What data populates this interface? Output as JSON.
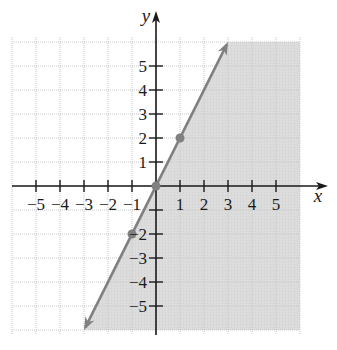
{
  "chart_data": {
    "type": "line",
    "title": "",
    "xlabel": "x",
    "ylabel": "y",
    "xlim": [
      -6,
      6
    ],
    "ylim": [
      -6,
      6
    ],
    "grid": true,
    "x_ticks": [
      -5,
      -4,
      -3,
      -2,
      -1,
      1,
      2,
      3,
      4,
      5
    ],
    "y_ticks": [
      -5,
      -4,
      -3,
      -2,
      1,
      2,
      3,
      4,
      5
    ],
    "x_tick_labels": [
      "−5",
      "−4",
      "−3",
      "−2",
      "−1",
      "1",
      "2",
      "3",
      "4",
      "5"
    ],
    "y_tick_labels": [
      "−5",
      "−4",
      "−3",
      "−2",
      "1",
      "2",
      "3",
      "4",
      "5"
    ],
    "series": [
      {
        "name": "boundary line y = 2x",
        "style": "solid",
        "x": [
          -3,
          3
        ],
        "y": [
          -6,
          6
        ],
        "arrows": "both"
      }
    ],
    "points": [
      {
        "x": -1,
        "y": -2
      },
      {
        "x": 0,
        "y": 0
      },
      {
        "x": 1,
        "y": 2
      }
    ],
    "shaded_region": "right of / below the line (y ≤ 2x)",
    "colors": {
      "shade": "#dadada",
      "line": "#808080",
      "grid": "#c8c8c8",
      "axis": "#1a1a1a"
    }
  }
}
